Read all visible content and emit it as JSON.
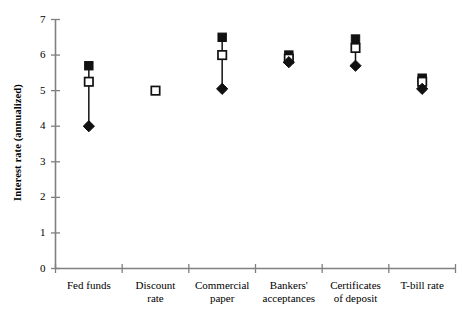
{
  "chart_data": {
    "type": "scatter",
    "title": "",
    "xlabel": "",
    "ylabel": "Interest rate (annualized)",
    "ylim": [
      0,
      7
    ],
    "yticks": [
      0,
      1,
      2,
      3,
      4,
      5,
      6,
      7
    ],
    "ytick_labels": [
      "0",
      "1",
      "2",
      "3",
      "4",
      "5",
      "6",
      "7"
    ],
    "grid": false,
    "legend": "none",
    "categories": [
      "Fed funds",
      "Discount\nrate",
      "Commercial\npaper",
      "Bankers'\nacceptances",
      "Certificates\nof deposit",
      "T-bill rate"
    ],
    "series": [
      {
        "name": "high",
        "marker": "filled-square",
        "values": [
          5.7,
          null,
          6.5,
          6.0,
          6.45,
          5.35
        ]
      },
      {
        "name": "mid",
        "marker": "open-square",
        "values": [
          5.25,
          5.0,
          6.0,
          5.9,
          6.2,
          5.25
        ]
      },
      {
        "name": "low",
        "marker": "filled-diamond",
        "values": [
          4.0,
          null,
          5.05,
          5.8,
          5.7,
          5.05
        ]
      }
    ],
    "connector_lines": [
      {
        "category": "Fed funds",
        "from": 4.0,
        "to": 5.7
      },
      {
        "category": "Commercial paper",
        "from": 5.05,
        "to": 6.5
      },
      {
        "category": "Bankers' acceptances",
        "from": 5.8,
        "to": 6.0
      },
      {
        "category": "Certificates of deposit",
        "from": 5.7,
        "to": 6.45
      },
      {
        "category": "T-bill rate",
        "from": 5.05,
        "to": 5.35
      }
    ],
    "colors": {
      "marker": "#111111",
      "axis": "#808080",
      "line": "#111111",
      "background": "#ffffff"
    }
  }
}
